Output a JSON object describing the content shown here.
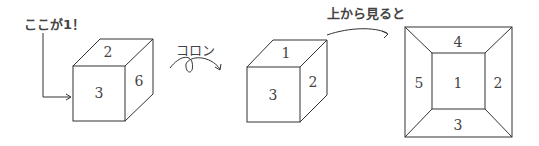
{
  "labels": {
    "here_is_one": "ここが1！",
    "roll": "コロン",
    "top_view": "上から見ると"
  },
  "cube1": {
    "top": "2",
    "front": "3",
    "right": "6"
  },
  "cube2": {
    "top": "1",
    "front": "3",
    "right": "2"
  },
  "top_view": {
    "top": "4",
    "left": "5",
    "center": "1",
    "right": "2",
    "bottom": "3"
  },
  "colors": {
    "line": "#333333",
    "text": "#444444"
  }
}
